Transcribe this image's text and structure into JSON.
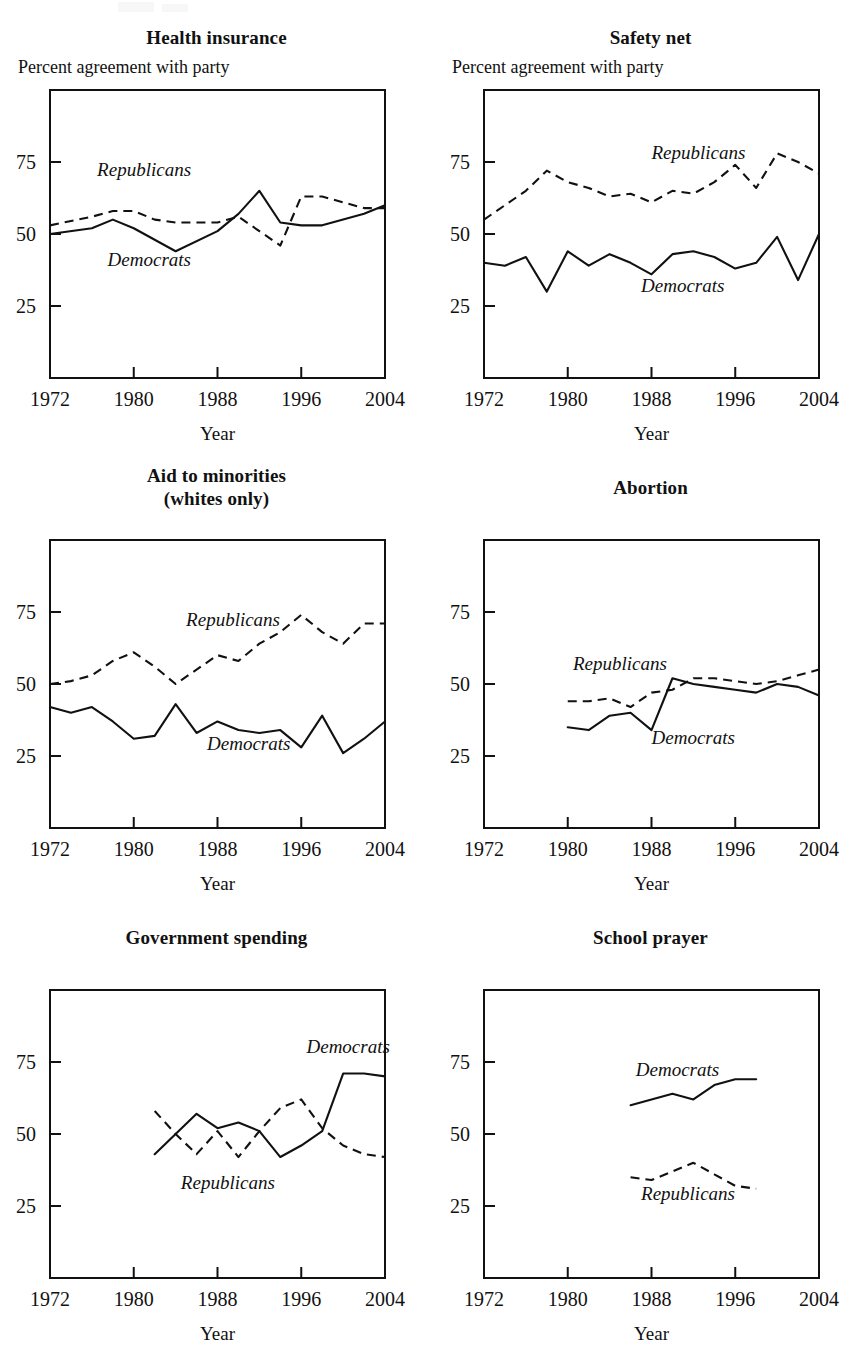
{
  "figure": {
    "layout": "2 columns x 3 rows of line charts",
    "y_axis_note": "Percent agreement with party",
    "x_axis_label": "Year",
    "y_tick_labels": [
      "25",
      "50",
      "75"
    ],
    "y_tick_values": [
      25,
      50,
      75
    ],
    "x_tick_labels": [
      "1972",
      "1980",
      "1988",
      "1996",
      "2004"
    ],
    "x_tick_values": [
      1972,
      1980,
      1988,
      1996,
      2004
    ],
    "series_labels": {
      "democrats": "Democrats",
      "republicans": "Republicans"
    },
    "colors": {
      "ink": "#111111",
      "background": "#ffffff"
    }
  },
  "chart_data": [
    {
      "id": "health-insurance",
      "type": "line",
      "title": "Health insurance",
      "title_lines": [
        "Health insurance"
      ],
      "show_axis_note": true,
      "ylabel": "Percent agreement with party",
      "xlabel": "Year",
      "xlim": [
        1972,
        2004
      ],
      "ylim": [
        0,
        100
      ],
      "yticks": [
        25,
        50,
        75
      ],
      "xticks": [
        1972,
        1980,
        1988,
        1996,
        2004
      ],
      "grid": false,
      "legend": "inline-annotations",
      "series": [
        {
          "name": "Democrats",
          "style": "solid",
          "x": [
            1972,
            1976,
            1978,
            1980,
            1982,
            1984,
            1988,
            1990,
            1992,
            1994,
            1996,
            1998,
            2000,
            2002,
            2004
          ],
          "values": [
            50,
            52,
            55,
            52,
            48,
            44,
            51,
            57,
            65,
            54,
            53,
            53,
            55,
            57,
            60
          ]
        },
        {
          "name": "Republicans",
          "style": "dashed",
          "x": [
            1972,
            1976,
            1978,
            1980,
            1982,
            1984,
            1988,
            1990,
            1992,
            1994,
            1996,
            1998,
            2000,
            2002,
            2004
          ],
          "values": [
            53,
            56,
            58,
            58,
            55,
            54,
            54,
            56,
            51,
            46,
            63,
            63,
            61,
            59,
            59
          ]
        }
      ],
      "annotations": [
        {
          "text": "Republicans",
          "x": 1976.5,
          "y": 70
        },
        {
          "text": "Democrats",
          "x": 1977.5,
          "y": 39
        }
      ]
    },
    {
      "id": "safety-net",
      "type": "line",
      "title": "Safety net",
      "title_lines": [
        "Safety net"
      ],
      "show_axis_note": true,
      "ylabel": "Percent agreement with party",
      "xlabel": "Year",
      "xlim": [
        1972,
        2004
      ],
      "ylim": [
        0,
        100
      ],
      "yticks": [
        25,
        50,
        75
      ],
      "xticks": [
        1972,
        1980,
        1988,
        1996,
        2004
      ],
      "grid": false,
      "legend": "inline-annotations",
      "series": [
        {
          "name": "Democrats",
          "style": "solid",
          "x": [
            1972,
            1974,
            1976,
            1978,
            1980,
            1982,
            1984,
            1986,
            1988,
            1990,
            1992,
            1994,
            1996,
            1998,
            2000,
            2002,
            2004
          ],
          "values": [
            40,
            39,
            42,
            30,
            44,
            39,
            43,
            40,
            36,
            43,
            44,
            42,
            38,
            40,
            49,
            34,
            50
          ]
        },
        {
          "name": "Republicans",
          "style": "dashed",
          "x": [
            1972,
            1974,
            1976,
            1978,
            1980,
            1982,
            1984,
            1986,
            1988,
            1990,
            1992,
            1994,
            1996,
            1998,
            2000,
            2002,
            2004
          ],
          "values": [
            55,
            60,
            65,
            72,
            68,
            66,
            63,
            64,
            61,
            65,
            64,
            68,
            74,
            66,
            78,
            75,
            71
          ]
        }
      ],
      "annotations": [
        {
          "text": "Republicans",
          "x": 1988,
          "y": 76
        },
        {
          "text": "Democrats",
          "x": 1987,
          "y": 30
        }
      ]
    },
    {
      "id": "aid-to-minorities",
      "type": "line",
      "title": "Aid to minorities (whites only)",
      "title_lines": [
        "Aid to minorities",
        "(whites only)"
      ],
      "show_axis_note": false,
      "ylabel": "Percent agreement with party",
      "xlabel": "Year",
      "xlim": [
        1972,
        2004
      ],
      "ylim": [
        0,
        100
      ],
      "yticks": [
        25,
        50,
        75
      ],
      "xticks": [
        1972,
        1980,
        1988,
        1996,
        2004
      ],
      "grid": false,
      "legend": "inline-annotations",
      "series": [
        {
          "name": "Democrats",
          "style": "solid",
          "x": [
            1972,
            1974,
            1976,
            1978,
            1980,
            1982,
            1984,
            1986,
            1988,
            1990,
            1992,
            1994,
            1996,
            1998,
            2000,
            2002,
            2004
          ],
          "values": [
            42,
            40,
            42,
            37,
            31,
            32,
            43,
            33,
            37,
            34,
            33,
            34,
            28,
            39,
            26,
            31,
            37
          ]
        },
        {
          "name": "Republicans",
          "style": "dashed",
          "x": [
            1972,
            1974,
            1976,
            1978,
            1980,
            1982,
            1984,
            1986,
            1988,
            1990,
            1992,
            1994,
            1996,
            1998,
            2000,
            2002,
            2004
          ],
          "values": [
            50,
            51,
            53,
            58,
            61,
            56,
            50,
            55,
            60,
            58,
            64,
            68,
            74,
            68,
            64,
            71,
            71
          ]
        }
      ],
      "annotations": [
        {
          "text": "Republicans",
          "x": 1985,
          "y": 70
        },
        {
          "text": "Democrats",
          "x": 1987,
          "y": 27
        }
      ]
    },
    {
      "id": "abortion",
      "type": "line",
      "title": "Abortion",
      "title_lines": [
        "Abortion"
      ],
      "show_axis_note": false,
      "ylabel": "Percent agreement with party",
      "xlabel": "Year",
      "xlim": [
        1972,
        2004
      ],
      "ylim": [
        0,
        100
      ],
      "yticks": [
        25,
        50,
        75
      ],
      "xticks": [
        1972,
        1980,
        1988,
        1996,
        2004
      ],
      "grid": false,
      "legend": "inline-annotations",
      "series": [
        {
          "name": "Democrats",
          "style": "solid",
          "x": [
            1980,
            1982,
            1984,
            1986,
            1988,
            1990,
            1992,
            1994,
            1996,
            1998,
            2000,
            2002,
            2004
          ],
          "values": [
            35,
            34,
            39,
            40,
            34,
            52,
            50,
            49,
            48,
            47,
            50,
            49,
            46
          ]
        },
        {
          "name": "Republicans",
          "style": "dashed",
          "x": [
            1980,
            1982,
            1984,
            1986,
            1988,
            1990,
            1992,
            1994,
            1996,
            1998,
            2000,
            2002,
            2004
          ],
          "values": [
            44,
            44,
            45,
            42,
            47,
            48,
            52,
            52,
            51,
            50,
            51,
            53,
            55
          ]
        }
      ],
      "annotations": [
        {
          "text": "Republicans",
          "x": 1980.5,
          "y": 55
        },
        {
          "text": "Democrats",
          "x": 1988,
          "y": 29
        }
      ]
    },
    {
      "id": "government-spending",
      "type": "line",
      "title": "Government spending",
      "title_lines": [
        "Government spending"
      ],
      "show_axis_note": false,
      "ylabel": "Percent agreement with party",
      "xlabel": "Year",
      "xlim": [
        1972,
        2004
      ],
      "ylim": [
        0,
        100
      ],
      "yticks": [
        25,
        50,
        75
      ],
      "xticks": [
        1972,
        1980,
        1988,
        1996,
        2004
      ],
      "grid": false,
      "legend": "inline-annotations",
      "series": [
        {
          "name": "Democrats",
          "style": "solid",
          "x": [
            1982,
            1984,
            1986,
            1988,
            1990,
            1992,
            1994,
            1996,
            1998,
            2000,
            2002,
            2004
          ],
          "values": [
            43,
            50,
            57,
            52,
            54,
            51,
            42,
            46,
            51,
            71,
            71,
            70
          ]
        },
        {
          "name": "Republicans",
          "style": "dashed",
          "x": [
            1982,
            1984,
            1986,
            1988,
            1990,
            1992,
            1994,
            1996,
            1998,
            2000,
            2002,
            2004
          ],
          "values": [
            58,
            50,
            43,
            51,
            42,
            51,
            59,
            62,
            52,
            46,
            43,
            42
          ]
        }
      ],
      "annotations": [
        {
          "text": "Democrats",
          "x": 1996.5,
          "y": 78
        },
        {
          "text": "Republicans",
          "x": 1984.5,
          "y": 31
        }
      ]
    },
    {
      "id": "school-prayer",
      "type": "line",
      "title": "School prayer",
      "title_lines": [
        "School prayer"
      ],
      "show_axis_note": false,
      "ylabel": "Percent agreement with party",
      "xlabel": "Year",
      "xlim": [
        1972,
        2004
      ],
      "ylim": [
        0,
        100
      ],
      "yticks": [
        25,
        50,
        75
      ],
      "xticks": [
        1972,
        1980,
        1988,
        1996,
        2004
      ],
      "grid": false,
      "legend": "inline-annotations",
      "series": [
        {
          "name": "Democrats",
          "style": "solid",
          "x": [
            1986,
            1988,
            1990,
            1992,
            1994,
            1996,
            1998
          ],
          "values": [
            60,
            62,
            64,
            62,
            67,
            69,
            69
          ]
        },
        {
          "name": "Republicans",
          "style": "dashed",
          "x": [
            1986,
            1988,
            1990,
            1992,
            1994,
            1996,
            1998
          ],
          "values": [
            35,
            34,
            37,
            40,
            36,
            32,
            31
          ]
        }
      ],
      "annotations": [
        {
          "text": "Democrats",
          "x": 1986.5,
          "y": 70
        },
        {
          "text": "Republicans",
          "x": 1987,
          "y": 27
        }
      ]
    }
  ]
}
